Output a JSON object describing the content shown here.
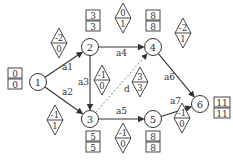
{
  "diagram": {
    "type": "activity-on-arrow network (AOA)",
    "nodes": [
      {
        "id": "1",
        "label": "1",
        "x": 38,
        "y": 82,
        "box": {
          "top": "0",
          "bottom": "0",
          "x": 8,
          "y": 68
        }
      },
      {
        "id": "2",
        "label": "2",
        "x": 90,
        "y": 47,
        "box": {
          "top": "3",
          "bottom": "3",
          "x": 86,
          "y": 10
        }
      },
      {
        "id": "3",
        "label": "3",
        "x": 90,
        "y": 119,
        "box": {
          "top": "5",
          "bottom": "5",
          "x": 86,
          "y": 131
        }
      },
      {
        "id": "4",
        "label": "4",
        "x": 153,
        "y": 47,
        "box": {
          "top": "8",
          "bottom": "8",
          "x": 146,
          "y": 10
        }
      },
      {
        "id": "5",
        "label": "5",
        "x": 153,
        "y": 119,
        "box": {
          "top": "8",
          "bottom": "8",
          "x": 146,
          "y": 131
        }
      },
      {
        "id": "6",
        "label": "6",
        "x": 200,
        "y": 104,
        "box": {
          "top": "11",
          "bottom": "11",
          "x": 214,
          "y": 97
        }
      }
    ],
    "edges": [
      {
        "label": "a1",
        "from": "1",
        "to": "2",
        "dashed": false,
        "label_x": 62,
        "label_y": 70,
        "diamond": {
          "top": "-2",
          "bottom": "0",
          "x": 59,
          "y": 43
        }
      },
      {
        "label": "a2",
        "from": "1",
        "to": "3",
        "dashed": false,
        "label_x": 62,
        "label_y": 95,
        "diamond": {
          "top": "-1",
          "bottom": "1",
          "x": 55,
          "y": 120
        }
      },
      {
        "label": "a3",
        "from": "2",
        "to": "3",
        "dashed": false,
        "label_x": 78,
        "label_y": 85,
        "diamond": {
          "top": "-1",
          "bottom": "0",
          "x": 102,
          "y": 80
        }
      },
      {
        "label": "a4",
        "from": "2",
        "to": "4",
        "dashed": false,
        "label_x": 116,
        "label_y": 56,
        "diamond": {
          "top": "0",
          "bottom": "1",
          "x": 123,
          "y": 18
        }
      },
      {
        "label": "d",
        "from": "3",
        "to": "4",
        "dashed": true,
        "label_x": 124,
        "label_y": 92,
        "diamond": {
          "top": "3",
          "bottom": "3",
          "x": 140,
          "y": 82
        }
      },
      {
        "label": "a5",
        "from": "3",
        "to": "5",
        "dashed": false,
        "label_x": 116,
        "label_y": 114,
        "diamond": {
          "top": "-1",
          "bottom": "0",
          "x": 123,
          "y": 138
        }
      },
      {
        "label": "a6",
        "from": "4",
        "to": "6",
        "dashed": false,
        "label_x": 164,
        "label_y": 80,
        "diamond": {
          "top": "-2",
          "bottom": "1",
          "x": 183,
          "y": 33
        }
      },
      {
        "label": "a7",
        "from": "5",
        "to": "6",
        "dashed": false,
        "label_x": 170,
        "label_y": 104,
        "diamond": {
          "top": "-1",
          "bottom": "0",
          "x": 182,
          "y": 118
        }
      }
    ]
  },
  "colors": {
    "line": "#333333",
    "dashed": "#888888",
    "text": "#333333",
    "background": "#ffffff"
  }
}
